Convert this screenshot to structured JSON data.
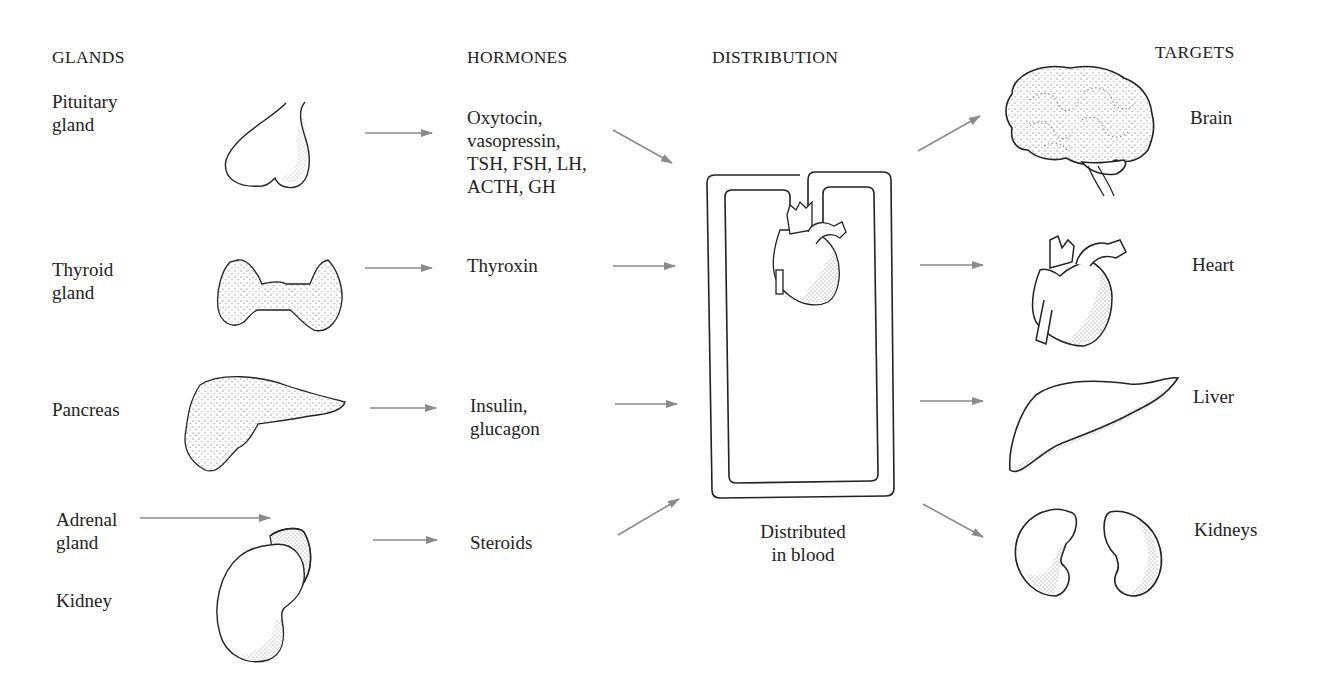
{
  "headers": {
    "glands": "GLANDS",
    "hormones": "HORMONES",
    "distribution": "DISTRIBUTION",
    "targets": "TARGETS"
  },
  "glands": [
    {
      "id": "pituitary",
      "label": "Pituitary\ngland",
      "icon": "pituitary-gland-icon"
    },
    {
      "id": "thyroid",
      "label": "Thyroid\ngland",
      "icon": "thyroid-gland-icon"
    },
    {
      "id": "pancreas",
      "label": "Pancreas",
      "icon": "pancreas-icon"
    },
    {
      "id": "adrenal",
      "label": "Adrenal\ngland",
      "icon": "adrenal-kidney-icon"
    },
    {
      "id": "kidney",
      "label": "Kidney",
      "icon": "adrenal-kidney-icon"
    }
  ],
  "hormones": [
    {
      "from": "pituitary",
      "label": "Oxytocin,\nvasopressin,\nTSH, FSH, LH,\nACTH, GH"
    },
    {
      "from": "thyroid",
      "label": "Thyroxin"
    },
    {
      "from": "pancreas",
      "label": "Insulin,\nglucagon"
    },
    {
      "from": "adrenal",
      "label": "Steroids"
    }
  ],
  "distribution": {
    "label": "Distributed\nin blood",
    "icon": "circulatory-loop-heart-icon"
  },
  "targets": [
    {
      "label": "Brain",
      "icon": "brain-icon"
    },
    {
      "label": "Heart",
      "icon": "heart-icon"
    },
    {
      "label": "Liver",
      "icon": "liver-icon"
    },
    {
      "label": "Kidneys",
      "icon": "kidneys-icon"
    }
  ],
  "colors": {
    "arrow": "#8a8a8a",
    "outline": "#222222",
    "text": "#222222"
  }
}
